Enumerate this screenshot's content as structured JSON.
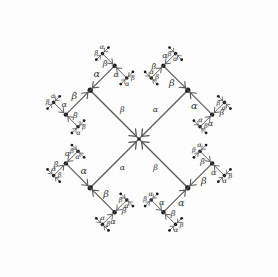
{
  "figure": {
    "type": "diagram",
    "width": 278,
    "height": 277,
    "background_color": "#fdfdfd",
    "line_color": "#555555",
    "node_color": "#1a1a1a",
    "label_color": "#333333",
    "label_alpha": "α",
    "label_beta": "β",
    "center_node": {
      "x": 139,
      "y": 139
    },
    "branch_angle_degrees": 45,
    "recursion_levels": 4,
    "root_arm_length": 69,
    "scale_factor": 0.5,
    "arrow_direction": "incoming toward parent node",
    "root_arms": [
      {
        "name": "up-left",
        "dx": -1,
        "dy": -1,
        "label_near_center": "β"
      },
      {
        "name": "up-right",
        "dx": 1,
        "dy": -1,
        "label_near_center": "α"
      },
      {
        "name": "down-left",
        "dx": -1,
        "dy": 1,
        "label_near_center": "α"
      },
      {
        "name": "down-right",
        "dx": 1,
        "dy": 1,
        "label_near_center": "β"
      }
    ],
    "labels_visible": [
      "α",
      "β"
    ]
  }
}
